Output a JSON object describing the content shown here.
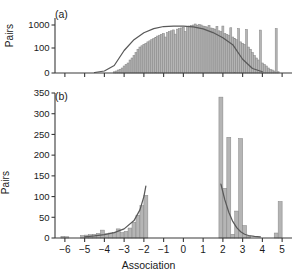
{
  "figure": {
    "xlabel": "Association",
    "panels": [
      {
        "tag": "(a)",
        "ylabel": "Pairs"
      },
      {
        "tag": "(b)",
        "ylabel": "Pairs"
      }
    ]
  },
  "colors": {
    "bar_fill": "#b5b5b5",
    "bar_stroke": "#8a8a8a",
    "curve": "#595959",
    "axis": "#3a3a3a",
    "text": "#1a1a1a",
    "background": "#ffffff"
  },
  "chart_data": [
    {
      "type": "bar",
      "panel": "(a)",
      "title": "",
      "xlabel": "Association",
      "ylabel": "Pairs",
      "xlim": [
        -6.5,
        5.5
      ],
      "ylim": [
        0,
        1350
      ],
      "yticks": [
        0,
        100,
        1000
      ],
      "ytick_labels": [
        "0",
        "100",
        "1000"
      ],
      "xticks": [
        -6,
        -5,
        -4,
        -3,
        -2,
        -1,
        0,
        1,
        2,
        3,
        4,
        5
      ],
      "grid": false,
      "legend": null,
      "bin_width": 0.1,
      "x": [
        -3.5,
        -3.4,
        -3.3,
        -3.2,
        -3.1,
        -3.0,
        -2.9,
        -2.8,
        -2.7,
        -2.6,
        -2.5,
        -2.4,
        -2.3,
        -2.2,
        -2.1,
        -2.0,
        -1.9,
        -1.8,
        -1.7,
        -1.6,
        -1.5,
        -1.4,
        -1.3,
        -1.2,
        -1.1,
        -1.0,
        -0.9,
        -0.8,
        -0.7,
        -0.6,
        -0.5,
        -0.4,
        -0.3,
        -0.2,
        -0.1,
        0.0,
        0.1,
        0.2,
        0.3,
        0.4,
        0.5,
        0.6,
        0.7,
        0.8,
        0.9,
        1.0,
        1.1,
        1.2,
        1.3,
        1.4,
        1.5,
        1.6,
        1.7,
        1.8,
        1.9,
        2.0,
        2.1,
        2.2,
        2.3,
        2.4,
        2.5,
        2.6,
        2.7,
        2.8,
        2.9,
        3.0,
        3.1,
        3.2,
        3.3,
        3.4,
        3.5,
        3.6,
        3.7,
        3.8,
        3.9,
        4.0,
        4.1,
        4.2,
        4.3,
        4.4,
        4.5,
        4.6,
        4.7,
        4.8,
        4.9
      ],
      "values": [
        5,
        8,
        12,
        15,
        20,
        28,
        34,
        40,
        52,
        60,
        70,
        82,
        95,
        110,
        125,
        145,
        160,
        185,
        205,
        230,
        260,
        290,
        330,
        360,
        395,
        430,
        300,
        470,
        520,
        560,
        610,
        400,
        660,
        700,
        745,
        800,
        520,
        860,
        900,
        950,
        1000,
        1100,
        980,
        1050,
        1000,
        900,
        860,
        820,
        960,
        740,
        700,
        660,
        880,
        560,
        520,
        900,
        430,
        395,
        360,
        760,
        300,
        260,
        230,
        700,
        185,
        160,
        145,
        640,
        110,
        95,
        82,
        70,
        60,
        52,
        600,
        40,
        34,
        28,
        20,
        15,
        12,
        8,
        700,
        5
      ],
      "overlay_curve": {
        "name": "fitted normal curve",
        "x": [
          -4.5,
          -4.0,
          -3.5,
          -3.0,
          -2.5,
          -2.0,
          -1.5,
          -1.0,
          -0.5,
          0.0,
          0.5,
          1.0,
          1.5,
          2.0,
          2.5,
          3.0,
          3.5,
          4.0
        ],
        "y": [
          2,
          8,
          30,
          90,
          230,
          460,
          700,
          860,
          900,
          890,
          820,
          680,
          470,
          280,
          140,
          55,
          18,
          5
        ]
      }
    },
    {
      "type": "bar",
      "panel": "(b)",
      "title": "",
      "xlabel": "Association",
      "ylabel": "Pairs",
      "xlim": [
        -6.5,
        5.5
      ],
      "ylim": [
        0,
        350
      ],
      "yticks": [
        0,
        50,
        100,
        150,
        200,
        250,
        300,
        350
      ],
      "ytick_labels": [
        "0",
        "50",
        "100",
        "150",
        "200",
        "250",
        "300",
        "350"
      ],
      "xticks": [
        -6,
        -5,
        -4,
        -3,
        -2,
        -1,
        0,
        1,
        2,
        3,
        4,
        5
      ],
      "grid": false,
      "legend": null,
      "bin_width": 0.2,
      "x": [
        -6.1,
        -5.9,
        -5.1,
        -4.9,
        -4.7,
        -4.5,
        -4.3,
        -4.1,
        -3.9,
        -3.7,
        -3.5,
        -3.3,
        -3.1,
        -2.9,
        -2.7,
        -2.5,
        -2.3,
        -2.1,
        -1.9,
        1.9,
        2.1,
        2.3,
        2.5,
        2.7,
        2.9,
        3.1,
        3.3,
        4.7,
        4.9
      ],
      "values": [
        4,
        3,
        6,
        7,
        8,
        9,
        11,
        19,
        10,
        12,
        13,
        22,
        13,
        16,
        24,
        38,
        55,
        78,
        103,
        340,
        120,
        243,
        9,
        65,
        240,
        30,
        5,
        12,
        88
      ],
      "overlay_curve": {
        "name": "fitted exponential tails",
        "left_x": [
          -5.0,
          -4.5,
          -4.0,
          -3.5,
          -3.0,
          -2.5,
          -2.2,
          -2.0,
          -1.9
        ],
        "left_y": [
          3,
          5,
          8,
          13,
          22,
          42,
          68,
          100,
          125
        ],
        "right_x": [
          1.9,
          2.1,
          2.3,
          2.5,
          2.7,
          2.9,
          3.1,
          3.3,
          3.6,
          3.9
        ],
        "right_y": [
          130,
          92,
          62,
          40,
          25,
          15,
          9,
          6,
          4,
          3
        ]
      }
    }
  ]
}
